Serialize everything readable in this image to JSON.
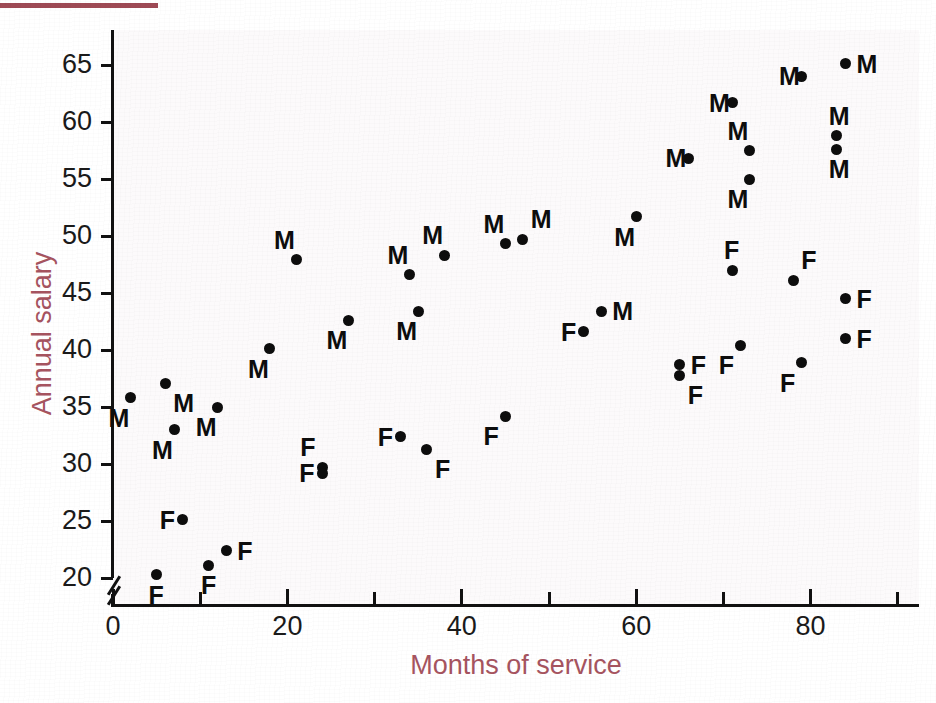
{
  "figure": {
    "top_rule_color": "#9e4a55",
    "axis_title_color": "#a6545f",
    "point_color": "#0d0d0d"
  },
  "chart_data": {
    "type": "scatter",
    "title": "",
    "xlabel": "Months of service",
    "ylabel": "Annual salary",
    "xlim": [
      0,
      92
    ],
    "ylim": [
      18.2,
      68.5
    ],
    "grid": false,
    "legend": "none",
    "axis_break_y": true,
    "x_ticks_major": [
      0,
      20,
      40,
      60,
      80
    ],
    "x_ticks_minor": [
      10,
      30,
      50,
      70,
      90
    ],
    "x_tick_labels": [
      "0",
      "20",
      "40",
      "60",
      "80"
    ],
    "y_ticks": [
      20,
      25,
      30,
      35,
      40,
      45,
      50,
      55,
      60,
      65
    ],
    "y_tick_labels": [
      "20",
      "25",
      "30",
      "35",
      "40",
      "45",
      "50",
      "55",
      "60",
      "65"
    ],
    "point_label_note": "Each point is annotated with M (male) or F (female)",
    "series": [
      {
        "name": "M",
        "marker_label": "M",
        "points": [
          {
            "x": 2,
            "y": 35.8,
            "label": "M",
            "lpos": "below-left"
          },
          {
            "x": 6,
            "y": 37.1,
            "label": "M",
            "lpos": "below-right"
          },
          {
            "x": 7,
            "y": 33.0,
            "label": "M",
            "lpos": "below-left"
          },
          {
            "x": 12,
            "y": 35.0,
            "label": "M",
            "lpos": "below-left"
          },
          {
            "x": 18,
            "y": 40.1,
            "label": "M",
            "lpos": "below-left"
          },
          {
            "x": 21,
            "y": 47.9,
            "label": "M",
            "lpos": "above-left"
          },
          {
            "x": 27,
            "y": 42.6,
            "label": "M",
            "lpos": "below-left"
          },
          {
            "x": 34,
            "y": 46.6,
            "label": "M",
            "lpos": "above-left"
          },
          {
            "x": 35,
            "y": 43.4,
            "label": "M",
            "lpos": "below-left"
          },
          {
            "x": 38,
            "y": 48.3,
            "label": "M",
            "lpos": "above-left"
          },
          {
            "x": 45,
            "y": 49.3,
            "label": "M",
            "lpos": "above-left"
          },
          {
            "x": 47,
            "y": 49.7,
            "label": "M",
            "lpos": "above-right"
          },
          {
            "x": 56,
            "y": 43.4,
            "label": "M",
            "lpos": "right"
          },
          {
            "x": 60,
            "y": 51.7,
            "label": "M",
            "lpos": "below-left"
          },
          {
            "x": 66,
            "y": 56.8,
            "label": "M",
            "lpos": "left"
          },
          {
            "x": 71,
            "y": 61.7,
            "label": "M",
            "lpos": "left"
          },
          {
            "x": 73,
            "y": 57.5,
            "label": "M",
            "lpos": "above-left"
          },
          {
            "x": 73,
            "y": 55.0,
            "label": "M",
            "lpos": "below-left"
          },
          {
            "x": 79,
            "y": 64.0,
            "label": "M",
            "lpos": "left"
          },
          {
            "x": 84,
            "y": 65.1,
            "label": "M",
            "lpos": "right"
          },
          {
            "x": 83,
            "y": 58.8,
            "label": "M",
            "lpos": "above-center"
          },
          {
            "x": 83,
            "y": 57.6,
            "label": "M",
            "lpos": "below-center"
          }
        ]
      },
      {
        "name": "F",
        "marker_label": "F",
        "points": [
          {
            "x": 5,
            "y": 20.3,
            "label": "F",
            "lpos": "below-center"
          },
          {
            "x": 8,
            "y": 25.1,
            "label": "F",
            "lpos": "left"
          },
          {
            "x": 11,
            "y": 21.1,
            "label": "F",
            "lpos": "below-center"
          },
          {
            "x": 13,
            "y": 22.4,
            "label": "F",
            "lpos": "right"
          },
          {
            "x": 24,
            "y": 29.7,
            "label": "F",
            "lpos": "above-left"
          },
          {
            "x": 24,
            "y": 29.2,
            "label": "F",
            "lpos": "left"
          },
          {
            "x": 33,
            "y": 32.4,
            "label": "F",
            "lpos": "left"
          },
          {
            "x": 36,
            "y": 31.3,
            "label": "F",
            "lpos": "below-right"
          },
          {
            "x": 45,
            "y": 34.2,
            "label": "F",
            "lpos": "below-left"
          },
          {
            "x": 54,
            "y": 41.6,
            "label": "F",
            "lpos": "left"
          },
          {
            "x": 65,
            "y": 38.7,
            "label": "F",
            "lpos": "right"
          },
          {
            "x": 65,
            "y": 37.8,
            "label": "F",
            "lpos": "below-right"
          },
          {
            "x": 71,
            "y": 47.0,
            "label": "F",
            "lpos": "above-center"
          },
          {
            "x": 72,
            "y": 40.4,
            "label": "F",
            "lpos": "below-left"
          },
          {
            "x": 78,
            "y": 46.1,
            "label": "F",
            "lpos": "above-right"
          },
          {
            "x": 79,
            "y": 38.9,
            "label": "F",
            "lpos": "below-left"
          },
          {
            "x": 84,
            "y": 44.5,
            "label": "F",
            "lpos": "right"
          },
          {
            "x": 84,
            "y": 41.0,
            "label": "F",
            "lpos": "right"
          }
        ]
      }
    ]
  }
}
